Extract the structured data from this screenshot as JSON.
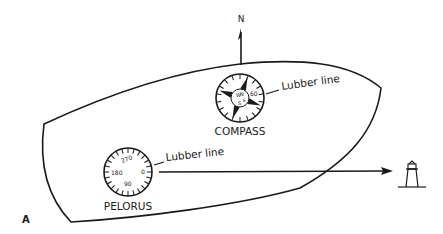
{
  "figure": {
    "panel_label": "A",
    "north_label": "N",
    "compass": {
      "label": "COMPASS",
      "lubber_label": "Lubber line",
      "card_marks": [
        "N",
        "E",
        "S",
        "W",
        "60"
      ]
    },
    "pelorus": {
      "label": "PELORUS",
      "lubber_label": "Lubber line",
      "card_marks": [
        "270",
        "180",
        "90",
        "0"
      ]
    },
    "landmark": "lighthouse",
    "colors": {
      "ink": "#1a1a1a",
      "background": "#ffffff"
    }
  }
}
